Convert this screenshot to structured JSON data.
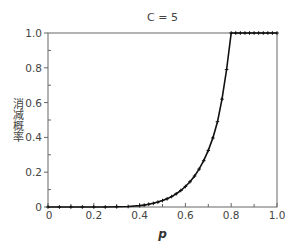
{
  "chart_data": {
    "type": "line",
    "title": "C = 5",
    "xlabel": "p",
    "ylabel": "消减概率",
    "xlim": [
      0,
      1
    ],
    "ylim": [
      0,
      1
    ],
    "grid": false,
    "legend": null,
    "x_ticks": [
      "0",
      "0.2",
      "0.4",
      "0.6",
      "0.8",
      "1.0"
    ],
    "y_ticks": [
      "0",
      "0.2",
      "0.4",
      "0.6",
      "0.8",
      "1.0"
    ],
    "series": [
      {
        "name": "C = 5",
        "marker": "+",
        "color": "#111111",
        "x": [
          0.0,
          0.05,
          0.1,
          0.15,
          0.2,
          0.25,
          0.3,
          0.35,
          0.4,
          0.42,
          0.44,
          0.46,
          0.48,
          0.5,
          0.52,
          0.54,
          0.56,
          0.58,
          0.6,
          0.62,
          0.64,
          0.66,
          0.68,
          0.7,
          0.72,
          0.74,
          0.76,
          0.78,
          0.8,
          0.82,
          0.84,
          0.86,
          0.88,
          0.9,
          0.92,
          0.94,
          0.96,
          0.98,
          1.0
        ],
        "y": [
          0.0,
          0.0,
          0.0,
          0.0,
          0.0,
          0.0,
          0.001,
          0.003,
          0.008,
          0.011,
          0.016,
          0.021,
          0.028,
          0.037,
          0.047,
          0.06,
          0.076,
          0.095,
          0.118,
          0.145,
          0.178,
          0.218,
          0.266,
          0.325,
          0.397,
          0.49,
          0.62,
          0.79,
          1.0,
          1.0,
          1.0,
          1.0,
          1.0,
          1.0,
          1.0,
          1.0,
          1.0,
          1.0,
          1.0
        ]
      }
    ]
  },
  "labels": {
    "title": "C = 5",
    "xlabel": "p",
    "ylabel": "消减概率"
  }
}
